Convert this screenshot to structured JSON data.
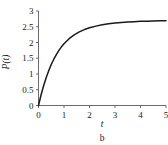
{
  "chart_data": {
    "type": "line",
    "title": "",
    "caption": "b",
    "xlabel": "t",
    "ylabel": "P(t)",
    "xlim": [
      0,
      5
    ],
    "ylim": [
      0,
      3
    ],
    "grid": false,
    "legend": null,
    "x_ticks": [
      "0",
      "1",
      "2",
      "3",
      "4",
      "5"
    ],
    "x_tick_values": [
      0,
      1,
      2,
      3,
      4,
      5
    ],
    "y_ticks": [
      "0",
      "0.5",
      "1",
      "1.5",
      "2",
      "2.5",
      "3"
    ],
    "y_tick_values": [
      0,
      0.5,
      1,
      1.5,
      2,
      2.5,
      3
    ],
    "series": [
      {
        "name": "P(t)",
        "color": "#1a1a1a",
        "asymptote": 2.75,
        "x": [
          0,
          0.1,
          0.2,
          0.3,
          0.4,
          0.5,
          0.6,
          0.7,
          0.8,
          0.9,
          1.0,
          1.2,
          1.4,
          1.6,
          1.8,
          2.0,
          2.25,
          2.5,
          2.75,
          3.0,
          3.25,
          3.5,
          3.75,
          4.0,
          4.25,
          4.5,
          4.75,
          5.0
        ],
        "values": [
          0,
          0.335,
          0.627,
          0.883,
          1.105,
          1.3,
          1.47,
          1.618,
          1.748,
          1.862,
          1.96,
          2.12,
          2.243,
          2.337,
          2.41,
          2.466,
          2.52,
          2.56,
          2.592,
          2.616,
          2.635,
          2.65,
          2.662,
          2.671,
          2.678,
          2.684,
          2.688,
          2.692
        ]
      }
    ]
  },
  "axis_color": "#6b6b6b",
  "background_color": "#ffffff"
}
